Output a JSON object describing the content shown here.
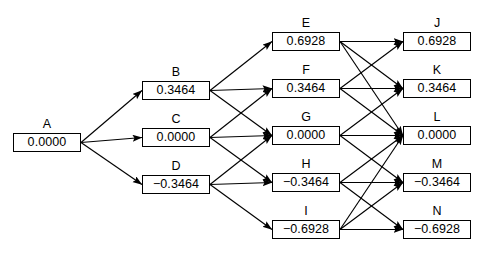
{
  "diagram": {
    "type": "lattice-trellis",
    "title": "",
    "background": "#ffffff",
    "line_color": "#000000",
    "box_border_color": "#000000",
    "box_fill": "#ffffff",
    "columns": [
      {
        "index": 0,
        "nodes": [
          "A"
        ]
      },
      {
        "index": 1,
        "nodes": [
          "B",
          "C",
          "D"
        ]
      },
      {
        "index": 2,
        "nodes": [
          "E",
          "F",
          "G",
          "H",
          "I"
        ]
      },
      {
        "index": 3,
        "nodes": [
          "J",
          "K",
          "L",
          "M",
          "N"
        ]
      }
    ],
    "nodes": [
      {
        "id": "A",
        "label": "A",
        "value": "0.0000",
        "col": 0,
        "row": 2,
        "x": 13,
        "y": 133,
        "w": 68,
        "h": 19
      },
      {
        "id": "B",
        "label": "B",
        "value": "0.3464",
        "col": 1,
        "row": 1,
        "x": 142,
        "y": 81,
        "w": 68,
        "h": 19
      },
      {
        "id": "C",
        "label": "C",
        "value": "0.0000",
        "col": 1,
        "row": 2,
        "x": 142,
        "y": 128,
        "w": 68,
        "h": 19
      },
      {
        "id": "D",
        "label": "D",
        "value": "−0.3464",
        "col": 1,
        "row": 3,
        "x": 142,
        "y": 175,
        "w": 68,
        "h": 19
      },
      {
        "id": "E",
        "label": "E",
        "value": "0.6928",
        "col": 2,
        "row": 0,
        "x": 272,
        "y": 32,
        "w": 68,
        "h": 19
      },
      {
        "id": "F",
        "label": "F",
        "value": "0.3464",
        "col": 2,
        "row": 1,
        "x": 272,
        "y": 79,
        "w": 68,
        "h": 19
      },
      {
        "id": "G",
        "label": "G",
        "value": "0.0000",
        "col": 2,
        "row": 2,
        "x": 272,
        "y": 126,
        "w": 68,
        "h": 19
      },
      {
        "id": "H",
        "label": "H",
        "value": "−0.3464",
        "col": 2,
        "row": 3,
        "x": 272,
        "y": 173,
        "w": 68,
        "h": 19
      },
      {
        "id": "I",
        "label": "I",
        "value": "−0.6928",
        "col": 2,
        "row": 4,
        "x": 272,
        "y": 220,
        "w": 68,
        "h": 19
      },
      {
        "id": "J",
        "label": "J",
        "value": "0.6928",
        "col": 3,
        "row": 0,
        "x": 403,
        "y": 32,
        "w": 68,
        "h": 19
      },
      {
        "id": "K",
        "label": "K",
        "value": "0.3464",
        "col": 3,
        "row": 1,
        "x": 403,
        "y": 79,
        "w": 68,
        "h": 19
      },
      {
        "id": "L",
        "label": "L",
        "value": "0.0000",
        "col": 3,
        "row": 2,
        "x": 403,
        "y": 126,
        "w": 68,
        "h": 19
      },
      {
        "id": "M",
        "label": "M",
        "value": "−0.3464",
        "col": 3,
        "row": 3,
        "x": 403,
        "y": 173,
        "w": 68,
        "h": 19
      },
      {
        "id": "N",
        "label": "N",
        "value": "−0.6928",
        "col": 3,
        "row": 4,
        "x": 403,
        "y": 220,
        "w": 68,
        "h": 19
      }
    ],
    "edges": [
      {
        "from": "A",
        "to": "B"
      },
      {
        "from": "A",
        "to": "C"
      },
      {
        "from": "A",
        "to": "D"
      },
      {
        "from": "B",
        "to": "E"
      },
      {
        "from": "B",
        "to": "F"
      },
      {
        "from": "B",
        "to": "G"
      },
      {
        "from": "C",
        "to": "F"
      },
      {
        "from": "C",
        "to": "G"
      },
      {
        "from": "C",
        "to": "H"
      },
      {
        "from": "D",
        "to": "G"
      },
      {
        "from": "D",
        "to": "H"
      },
      {
        "from": "D",
        "to": "I"
      },
      {
        "from": "E",
        "to": "J"
      },
      {
        "from": "E",
        "to": "K"
      },
      {
        "from": "E",
        "to": "L"
      },
      {
        "from": "F",
        "to": "J"
      },
      {
        "from": "F",
        "to": "K"
      },
      {
        "from": "F",
        "to": "L"
      },
      {
        "from": "G",
        "to": "K"
      },
      {
        "from": "G",
        "to": "L"
      },
      {
        "from": "G",
        "to": "M"
      },
      {
        "from": "H",
        "to": "L"
      },
      {
        "from": "H",
        "to": "M"
      },
      {
        "from": "H",
        "to": "N"
      },
      {
        "from": "I",
        "to": "L"
      },
      {
        "from": "I",
        "to": "M"
      },
      {
        "from": "I",
        "to": "N"
      }
    ]
  }
}
